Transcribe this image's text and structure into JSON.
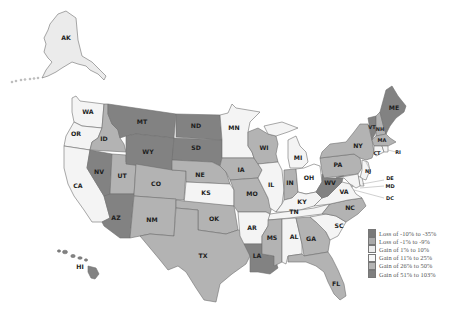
{
  "legend": {
    "items": [
      {
        "label": "Loss of -10%  to -35%",
        "color": "#797979"
      },
      {
        "label": "Loss of -1%  to -9%",
        "color": "#a9a9a9"
      },
      {
        "label": "Gain of 1%  to 10%",
        "color": "#ececec"
      },
      {
        "label": "Gain of 11%  to 25%",
        "color": "#f7f7f7"
      },
      {
        "label": "Gain of 26%  to 50%",
        "color": "#b4b4b4"
      },
      {
        "label": "Gain of 51%  to 103%",
        "color": "#7f7f7f"
      }
    ]
  },
  "tiers": {
    "dark": "#828282",
    "medium": "#b3b3b3",
    "light": "#ebebeb",
    "lighter": "#f4f4f4"
  },
  "states": {
    "AK": {
      "label": "AK",
      "tier": "light"
    },
    "WA": {
      "label": "WA",
      "tier": "lighter"
    },
    "OR": {
      "label": "OR",
      "tier": "lighter"
    },
    "CA": {
      "label": "CA",
      "tier": "lighter"
    },
    "ID": {
      "label": "ID",
      "tier": "medium"
    },
    "NV": {
      "label": "NV",
      "tier": "dark"
    },
    "UT": {
      "label": "UT",
      "tier": "medium"
    },
    "AZ": {
      "label": "AZ",
      "tier": "dark"
    },
    "MT": {
      "label": "MT",
      "tier": "dark"
    },
    "WY": {
      "label": "WY",
      "tier": "dark"
    },
    "CO": {
      "label": "CO",
      "tier": "medium"
    },
    "NM": {
      "label": "NM",
      "tier": "medium"
    },
    "ND": {
      "label": "ND",
      "tier": "dark"
    },
    "SD": {
      "label": "SD",
      "tier": "dark"
    },
    "NE": {
      "label": "NE",
      "tier": "medium"
    },
    "KS": {
      "label": "KS",
      "tier": "lighter"
    },
    "OK": {
      "label": "OK",
      "tier": "medium"
    },
    "TX": {
      "label": "TX",
      "tier": "medium"
    },
    "MN": {
      "label": "MN",
      "tier": "lighter"
    },
    "IA": {
      "label": "IA",
      "tier": "medium"
    },
    "MO": {
      "label": "MO",
      "tier": "medium"
    },
    "AR": {
      "label": "AR",
      "tier": "lighter"
    },
    "LA": {
      "label": "LA",
      "tier": "dark"
    },
    "WI": {
      "label": "WI",
      "tier": "medium"
    },
    "IL": {
      "label": "IL",
      "tier": "lighter"
    },
    "MI": {
      "label": "MI",
      "tier": "lighter"
    },
    "IN": {
      "label": "IN",
      "tier": "medium"
    },
    "OH": {
      "label": "OH",
      "tier": "white"
    },
    "KY": {
      "label": "KY",
      "tier": "lighter"
    },
    "TN": {
      "label": "TN",
      "tier": "lighter"
    },
    "MS": {
      "label": "MS",
      "tier": "medium"
    },
    "AL": {
      "label": "AL",
      "tier": "lighter"
    },
    "GA": {
      "label": "GA",
      "tier": "medium"
    },
    "FL": {
      "label": "FL",
      "tier": "medium"
    },
    "SC": {
      "label": "SC",
      "tier": "lighter"
    },
    "NC": {
      "label": "NC",
      "tier": "medium"
    },
    "VA": {
      "label": "VA",
      "tier": "lighter"
    },
    "WV": {
      "label": "WV",
      "tier": "dark"
    },
    "PA": {
      "label": "PA",
      "tier": "medium"
    },
    "NY": {
      "label": "NY",
      "tier": "medium"
    },
    "VT": {
      "label": "VT",
      "tier": "dark"
    },
    "NH": {
      "label": "NH",
      "tier": "medium"
    },
    "ME": {
      "label": "ME",
      "tier": "dark"
    },
    "MA": {
      "label": "MA",
      "tier": "medium"
    },
    "CT": {
      "label": "CT",
      "tier": "lighter"
    },
    "RI": {
      "label": "RI",
      "tier": "lighter"
    },
    "NJ": {
      "label": "NJ",
      "tier": "lighter"
    },
    "DE": {
      "label": "DE",
      "tier": "lighter"
    },
    "MD": {
      "label": "MD",
      "tier": "lighter"
    },
    "DC": {
      "label": "DC",
      "tier": "lighter"
    },
    "HI": {
      "label": "HI",
      "tier": "dark"
    }
  }
}
